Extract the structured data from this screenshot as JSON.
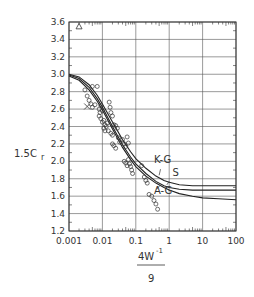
{
  "chart_data": {
    "type": "scatter",
    "title": "",
    "xlabel": "4W^-1 / 9",
    "xlabel_numerator": "4W",
    "xlabel_exponent": "-1",
    "xlabel_denominator": "9",
    "ylabel": "1.5C_r",
    "ylabel_main": "1.5C",
    "ylabel_sub": "r",
    "xscale": "log",
    "xlim": [
      0.001,
      100
    ],
    "ylim": [
      1.2,
      3.6
    ],
    "grid": true,
    "x_ticks": [
      0.001,
      0.01,
      0.1,
      1,
      10,
      100
    ],
    "x_tick_labels": [
      "0.001",
      "0.01",
      "0.1",
      "1",
      "10",
      "100"
    ],
    "y_ticks": [
      1.2,
      1.4,
      1.6,
      1.8,
      2.0,
      2.2,
      2.4,
      2.6,
      2.8,
      3.0,
      3.2,
      3.4,
      3.6
    ],
    "y_tick_labels": [
      "1.2",
      "1.4",
      "1.6",
      "1.8",
      "2.0",
      "2.2",
      "2.4",
      "2.6",
      "2.8",
      "3.0",
      "3.2",
      "3.4",
      "3.6"
    ],
    "series": [
      {
        "name": "K-G",
        "kind": "line",
        "x": [
          0.001,
          0.002,
          0.004,
          0.007,
          0.01,
          0.02,
          0.04,
          0.07,
          0.1,
          0.2,
          0.4,
          0.7,
          1,
          2,
          5,
          10,
          30,
          100
        ],
        "y": [
          3.0,
          2.97,
          2.88,
          2.76,
          2.66,
          2.45,
          2.25,
          2.11,
          2.03,
          1.92,
          1.83,
          1.78,
          1.76,
          1.73,
          1.72,
          1.72,
          1.72,
          1.72
        ]
      },
      {
        "name": "S",
        "kind": "line",
        "x": [
          0.001,
          0.002,
          0.004,
          0.007,
          0.01,
          0.02,
          0.04,
          0.07,
          0.1,
          0.2,
          0.4,
          0.7,
          1,
          2,
          5,
          10,
          30,
          100
        ],
        "y": [
          2.99,
          2.95,
          2.85,
          2.72,
          2.62,
          2.4,
          2.19,
          2.05,
          1.97,
          1.86,
          1.77,
          1.72,
          1.7,
          1.68,
          1.67,
          1.67,
          1.67,
          1.67
        ]
      },
      {
        "name": "A-G",
        "kind": "line",
        "x": [
          0.001,
          0.002,
          0.004,
          0.007,
          0.01,
          0.02,
          0.04,
          0.07,
          0.1,
          0.2,
          0.4,
          0.7,
          1,
          2,
          5,
          10,
          30,
          100
        ],
        "y": [
          2.98,
          2.93,
          2.82,
          2.69,
          2.59,
          2.37,
          2.16,
          2.02,
          1.94,
          1.83,
          1.75,
          1.7,
          1.67,
          1.63,
          1.6,
          1.58,
          1.57,
          1.56
        ]
      },
      {
        "name": "data",
        "kind": "points",
        "marker": "circle",
        "x": [
          0.003,
          0.0035,
          0.005,
          0.004,
          0.0045,
          0.005,
          0.006,
          0.007,
          0.0085,
          0.008,
          0.009,
          0.01,
          0.011,
          0.012,
          0.013,
          0.008,
          0.009,
          0.01,
          0.011,
          0.012,
          0.016,
          0.017,
          0.018,
          0.02,
          0.014,
          0.015,
          0.018,
          0.02,
          0.022,
          0.025,
          0.028,
          0.02,
          0.022,
          0.025,
          0.03,
          0.033,
          0.04,
          0.045,
          0.05,
          0.055,
          0.06,
          0.045,
          0.05,
          0.055,
          0.06,
          0.065,
          0.07,
          0.075,
          0.08,
          0.15,
          0.18,
          0.2,
          0.22,
          0.25,
          0.3,
          0.35,
          0.4,
          0.45
        ],
        "y": [
          2.82,
          2.75,
          2.86,
          2.7,
          2.66,
          2.62,
          2.65,
          2.86,
          2.56,
          2.52,
          2.49,
          2.45,
          2.47,
          2.42,
          2.4,
          2.6,
          2.64,
          2.58,
          2.38,
          2.35,
          2.68,
          2.62,
          2.56,
          2.52,
          2.44,
          2.35,
          2.32,
          2.3,
          2.42,
          2.41,
          2.38,
          2.2,
          2.18,
          2.15,
          2.27,
          2.22,
          2.25,
          2.2,
          2.17,
          2.28,
          2.21,
          2.0,
          1.98,
          1.95,
          2.02,
          1.97,
          1.94,
          1.9,
          1.86,
          1.95,
          1.82,
          1.78,
          1.75,
          1.62,
          1.6,
          1.55,
          1.51,
          1.45
        ]
      },
      {
        "name": "cross",
        "kind": "points",
        "marker": "x",
        "x": [
          0.0035
        ],
        "y": [
          2.63
        ]
      },
      {
        "name": "triangle",
        "kind": "points",
        "marker": "triangle",
        "x": [
          0.002
        ],
        "y": [
          3.55
        ]
      }
    ],
    "annotations": [
      {
        "text": "K-G",
        "x": 0.35,
        "y": 1.98
      },
      {
        "text": "S",
        "x": 1.25,
        "y": 1.83
      },
      {
        "text": "A-G",
        "x": 0.35,
        "y": 1.62
      }
    ]
  }
}
